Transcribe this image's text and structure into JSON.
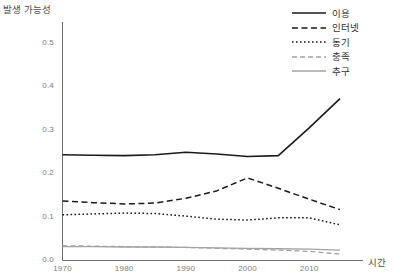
{
  "chart_data": {
    "type": "line",
    "title": "",
    "ylabel": "발생 가능성",
    "xlabel": "시간",
    "xlim": [
      1968,
      2018
    ],
    "ylim": [
      0.0,
      0.55
    ],
    "grid": false,
    "legend_position": "top-right",
    "y_ticks": [
      "0.0",
      "0.1",
      "0.2",
      "0.3",
      "0.4",
      "0.5"
    ],
    "y_tick_values": [
      0.0,
      0.1,
      0.2,
      0.3,
      0.4,
      0.5
    ],
    "x_ticks": [
      "1970",
      "1980",
      "1990",
      "2000",
      "2010"
    ],
    "x_tick_values": [
      1970,
      1980,
      1990,
      2000,
      2010
    ],
    "x": [
      1970,
      1975,
      1980,
      1985,
      1990,
      1995,
      2000,
      2005,
      2010,
      2015
    ],
    "series": [
      {
        "name": "이용",
        "style": "solid",
        "color": "#1a1a1a",
        "width": 1.6,
        "values": [
          0.243,
          0.242,
          0.241,
          0.243,
          0.249,
          0.245,
          0.239,
          0.241,
          0.305,
          0.372
        ]
      },
      {
        "name": "인터넷",
        "style": "dashed",
        "color": "#1a1a1a",
        "width": 1.5,
        "values": [
          0.137,
          0.133,
          0.13,
          0.132,
          0.143,
          0.16,
          0.19,
          0.166,
          0.141,
          0.117
        ]
      },
      {
        "name": "동기",
        "style": "dotted",
        "color": "#1a1a1a",
        "width": 1.5,
        "values": [
          0.105,
          0.107,
          0.109,
          0.108,
          0.102,
          0.095,
          0.093,
          0.098,
          0.098,
          0.082
        ]
      },
      {
        "name": "충족",
        "style": "dashed",
        "color": "#a3a3a5",
        "width": 1.3,
        "values": [
          0.034,
          0.033,
          0.032,
          0.031,
          0.03,
          0.028,
          0.026,
          0.024,
          0.021,
          0.015
        ]
      },
      {
        "name": "추구",
        "style": "solid",
        "color": "#a3a3a5",
        "width": 1.3,
        "values": [
          0.032,
          0.032,
          0.031,
          0.031,
          0.03,
          0.029,
          0.028,
          0.027,
          0.026,
          0.024
        ]
      }
    ]
  },
  "axes": {
    "y_title": "발생 가능성",
    "x_title": "시간"
  },
  "legend": {
    "items": [
      {
        "label": "이용"
      },
      {
        "label": "인터넷"
      },
      {
        "label": "동기"
      },
      {
        "label": "충족"
      },
      {
        "label": "추구"
      }
    ]
  },
  "y_tick_labels": [
    "0.5",
    "0.4",
    "0.3",
    "0.2",
    "0.1",
    "0.0"
  ],
  "x_tick_labels": [
    "1970",
    "1980",
    "1990",
    "2000",
    "2010"
  ]
}
